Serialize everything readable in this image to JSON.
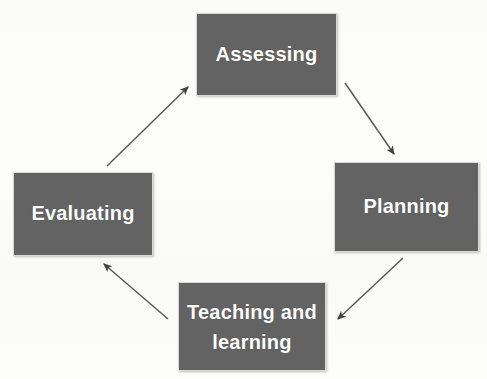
{
  "diagram": {
    "type": "cycle-diagram",
    "title_visible": false,
    "background_color": "#fcfcfb",
    "node_fill_color": "#636363",
    "node_text_color": "#ffffff",
    "arrow_color": "#555555",
    "nodes": [
      {
        "id": "assessing",
        "label": "Assessing",
        "position": "top"
      },
      {
        "id": "planning",
        "label": "Planning",
        "position": "right"
      },
      {
        "id": "teaching",
        "label": "Teaching and\nlearning",
        "position": "bottom"
      },
      {
        "id": "evaluating",
        "label": "Evaluating",
        "position": "left"
      }
    ],
    "arrows": [
      {
        "id": "evaluating-to-assessing",
        "from": "evaluating",
        "to": "assessing",
        "direction": "up-right"
      },
      {
        "id": "assessing-to-planning",
        "from": "assessing",
        "to": "planning",
        "direction": "down-right"
      },
      {
        "id": "planning-to-teaching",
        "from": "planning",
        "to": "teaching",
        "direction": "down-left"
      },
      {
        "id": "teaching-to-evaluating",
        "from": "teaching",
        "to": "evaluating",
        "direction": "up-left"
      }
    ]
  }
}
